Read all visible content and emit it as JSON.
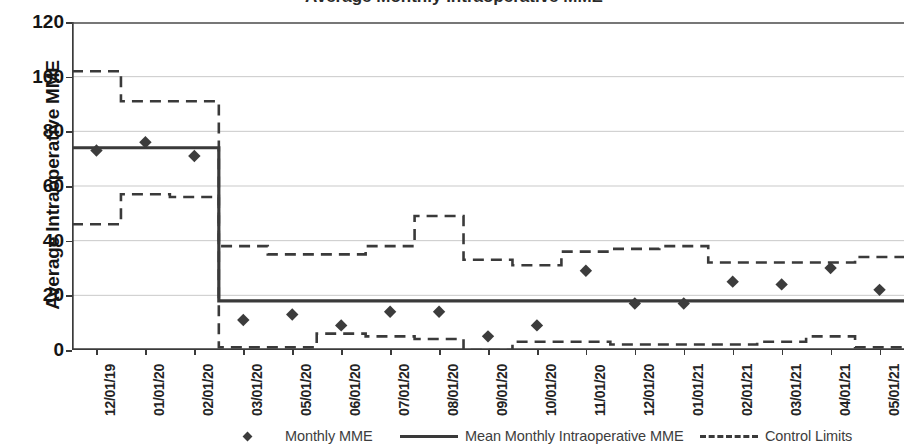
{
  "chart_data": {
    "type": "line",
    "title": "Average Monthly Intraoperative MME",
    "xlabel": "",
    "ylabel": "Average Intraoperative MME",
    "ylim": [
      0,
      120
    ],
    "yticks": [
      0,
      20,
      40,
      60,
      80,
      100,
      120
    ],
    "grid": true,
    "legend_position": "bottom",
    "categories": [
      "12/01/19",
      "01/01/20",
      "02/01/20",
      "03/01/20",
      "05/01/20",
      "06/01/20",
      "07/01/20",
      "08/01/20",
      "09/01/20",
      "10/01/20",
      "11/01/20",
      "12/01/20",
      "01/01/21",
      "02/01/21",
      "03/01/21",
      "04/01/21",
      "05/01/21"
    ],
    "series": [
      {
        "name": "Monthly MME",
        "style": "markers",
        "values": [
          73,
          76,
          71,
          11,
          13,
          9,
          14,
          14,
          5,
          9,
          29,
          17,
          17,
          25,
          24,
          30,
          22
        ]
      },
      {
        "name": "Mean Monthly Intraoperative MME",
        "style": "solid",
        "values": [
          74,
          74,
          74,
          18,
          18,
          18,
          18,
          18,
          18,
          18,
          18,
          18,
          18,
          18,
          18,
          18,
          18
        ]
      },
      {
        "name": "Control Limits",
        "style": "dashed",
        "sublabel": "upper",
        "values": [
          102,
          91,
          91,
          38,
          35,
          35,
          38,
          49,
          33,
          31,
          36,
          37,
          38,
          32,
          32,
          32,
          34
        ]
      },
      {
        "name": "Control Limits",
        "style": "dashed",
        "sublabel": "lower",
        "values": [
          46,
          57,
          56,
          1,
          1,
          6,
          5,
          4,
          0,
          3,
          3,
          2,
          2,
          2,
          3,
          5,
          1
        ]
      }
    ],
    "legend": [
      {
        "label": "Monthly MME",
        "marker": "diamond-marker"
      },
      {
        "label": "Mean Monthly Intraoperative MME",
        "marker": "solid-line"
      },
      {
        "label": "Control Limits",
        "marker": "dashed-line"
      }
    ]
  }
}
